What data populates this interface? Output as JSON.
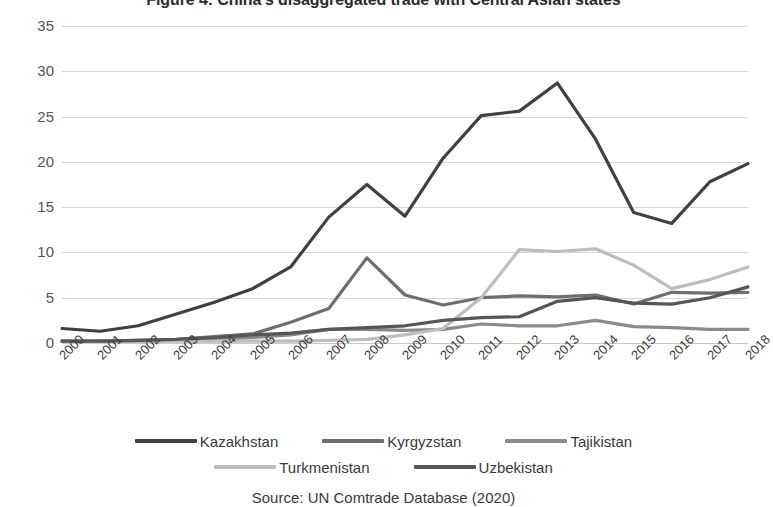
{
  "chart_data": {
    "type": "line",
    "title": "Figure 4: China's disaggregated trade with Central Asian states",
    "xlabel": "",
    "ylabel": "US$ Billions",
    "ylim": [
      0,
      35
    ],
    "ytick_step": 5,
    "yticks": [
      "35",
      "30",
      "25",
      "20",
      "15",
      "10",
      "5",
      "0"
    ],
    "grid": true,
    "legend_position": "bottom",
    "source": "Source: UN Comtrade Database (2020)",
    "categories": [
      "2000",
      "2001",
      "2002",
      "2003",
      "2004",
      "2005",
      "2006",
      "2007",
      "2008",
      "2009",
      "2010",
      "2011",
      "2012",
      "2013",
      "2014",
      "2015",
      "2016",
      "2017",
      "2018"
    ],
    "series": [
      {
        "name": "Kazakhstan",
        "color": "#404040",
        "values": [
          1.6,
          1.3,
          1.9,
          3.2,
          4.5,
          6.0,
          8.4,
          13.9,
          17.5,
          14.0,
          20.4,
          25.1,
          25.6,
          28.7,
          22.5,
          14.4,
          13.2,
          17.8,
          19.8
        ]
      },
      {
        "name": "Kyrgyzstan",
        "color": "#6e6e6e",
        "values": [
          0.2,
          0.2,
          0.3,
          0.4,
          0.7,
          1.0,
          2.3,
          3.8,
          9.4,
          5.3,
          4.2,
          5.0,
          5.2,
          5.1,
          5.3,
          4.3,
          5.6,
          5.5,
          5.6
        ]
      },
      {
        "name": "Tajikistan",
        "color": "#8a8a8a",
        "values": [
          0.2,
          0.2,
          0.2,
          0.3,
          0.4,
          0.6,
          0.9,
          1.5,
          1.5,
          1.4,
          1.5,
          2.1,
          1.9,
          1.9,
          2.5,
          1.8,
          1.7,
          1.5,
          1.5
        ]
      },
      {
        "name": "Turkmenistan",
        "color": "#bdbdbd",
        "values": [
          0.2,
          0.2,
          0.2,
          0.2,
          0.2,
          0.2,
          0.2,
          0.3,
          0.4,
          0.9,
          1.6,
          5.0,
          10.3,
          10.1,
          10.4,
          8.6,
          6.0,
          7.0,
          8.4
        ]
      },
      {
        "name": "Uzbekistan",
        "color": "#565656",
        "values": [
          0.2,
          0.2,
          0.3,
          0.4,
          0.6,
          0.9,
          1.1,
          1.5,
          1.7,
          1.9,
          2.5,
          2.8,
          2.9,
          4.6,
          5.0,
          4.4,
          4.3,
          5.0,
          6.2
        ]
      }
    ]
  }
}
